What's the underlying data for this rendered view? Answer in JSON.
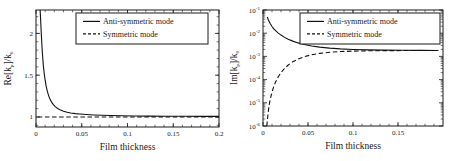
{
  "figure": {
    "name": "surface-plasmon-mode-dispersion",
    "panel_count": 2
  },
  "chart_data": [
    {
      "id": "left",
      "type": "line",
      "title": "",
      "xlabel": "Film thickness",
      "ylabel": "Re[k_p]/k_0",
      "ylabel_parts": {
        "prefix": "Re[k",
        "sub": "p",
        "mid": "]/k",
        "sub2": "0"
      },
      "xlim": [
        0,
        0.2
      ],
      "ylim": [
        0.88,
        2.28
      ],
      "xticks": [
        0,
        0.05,
        0.1,
        0.15,
        0.2
      ],
      "xtick_labels": [
        "0",
        "0.05",
        "0.1",
        "0.15",
        "0.2"
      ],
      "yticks": [
        1,
        1.5,
        2
      ],
      "ytick_labels": [
        "1",
        "1.5",
        "2"
      ],
      "yscale": "linear",
      "grid": false,
      "legend_position": "top-right",
      "series": [
        {
          "name": "Anti-symmetric mode",
          "style": "solid",
          "x": [
            0.0045,
            0.005,
            0.0055,
            0.006,
            0.0065,
            0.007,
            0.008,
            0.009,
            0.01,
            0.011,
            0.012,
            0.013,
            0.014,
            0.015,
            0.017,
            0.019,
            0.021,
            0.024,
            0.027,
            0.03,
            0.034,
            0.038,
            0.043,
            0.048,
            0.055,
            0.063,
            0.072,
            0.082,
            0.094,
            0.108,
            0.124,
            0.142,
            0.162,
            0.182,
            0.2
          ],
          "y": [
            2.28,
            2.18,
            2.06,
            1.95,
            1.85,
            1.76,
            1.62,
            1.52,
            1.44,
            1.375,
            1.325,
            1.285,
            1.25,
            1.222,
            1.178,
            1.147,
            1.124,
            1.099,
            1.082,
            1.069,
            1.057,
            1.048,
            1.04,
            1.035,
            1.029,
            1.024,
            1.02,
            1.017,
            1.014,
            1.012,
            1.01,
            1.009,
            1.008,
            1.007,
            1.007
          ]
        },
        {
          "name": "Symmetric mode",
          "style": "dashed",
          "x": [
            0.002,
            0.01,
            0.02,
            0.04,
            0.06,
            0.08,
            0.1,
            0.12,
            0.14,
            0.16,
            0.18,
            0.2
          ],
          "y": [
            0.999,
            0.999,
            0.999,
            1.0,
            1.0,
            1.0,
            1.0,
            1.0,
            1.0,
            1.0,
            1.0,
            1.0
          ]
        }
      ]
    },
    {
      "id": "right",
      "type": "line",
      "title": "",
      "xlabel": "Film thickness",
      "ylabel": "Im[k_p]/k_0",
      "ylabel_parts": {
        "prefix": "Im[k",
        "sub": "p",
        "mid": "]/k",
        "sub2": "0"
      },
      "xlim": [
        0,
        0.2
      ],
      "ylim": [
        1e-06,
        0.1
      ],
      "xticks": [
        0,
        0.05,
        0.1,
        0.15
      ],
      "xtick_labels": [
        "0",
        "0.05",
        "0.1",
        "0.15"
      ],
      "yticks": [
        0.1,
        0.01,
        0.001,
        0.0001,
        1e-05,
        1e-06
      ],
      "ytick_labels": [
        "10-1",
        "10-2",
        "10-3",
        "10-4",
        "10-5",
        "10-6"
      ],
      "ytick_exponents": [
        "-1",
        "-2",
        "-3",
        "-4",
        "-5",
        "-6"
      ],
      "ytick_mantissa": "10",
      "yscale": "log",
      "grid": false,
      "legend_position": "top-right",
      "series": [
        {
          "name": "Anti-symmetric mode",
          "style": "solid",
          "x": [
            0.0048,
            0.006,
            0.007,
            0.008,
            0.01,
            0.012,
            0.014,
            0.017,
            0.02,
            0.024,
            0.028,
            0.033,
            0.039,
            0.046,
            0.054,
            0.063,
            0.074,
            0.086,
            0.1,
            0.116,
            0.134,
            0.154,
            0.175,
            0.195
          ],
          "y": [
            0.05,
            0.037,
            0.031,
            0.026,
            0.0195,
            0.0155,
            0.0128,
            0.0101,
            0.0083,
            0.0066,
            0.0055,
            0.00455,
            0.00382,
            0.00325,
            0.00283,
            0.00252,
            0.00228,
            0.00211,
            0.00199,
            0.00191,
            0.00186,
            0.00183,
            0.00181,
            0.0018
          ]
        },
        {
          "name": "Symmetric mode",
          "style": "dashed",
          "x": [
            0.0042,
            0.005,
            0.006,
            0.007,
            0.008,
            0.01,
            0.012,
            0.014,
            0.017,
            0.02,
            0.024,
            0.028,
            0.033,
            0.039,
            0.046,
            0.054,
            0.063,
            0.074,
            0.086,
            0.1,
            0.116,
            0.134,
            0.154,
            0.175,
            0.195
          ],
          "y": [
            1e-06,
            2e-06,
            4.6e-06,
            8.5e-06,
            1.38e-05,
            2.9e-05,
            5.1e-05,
            7.9e-05,
            0.000133,
            0.000199,
            0.000305,
            0.000425,
            0.000585,
            0.00077,
            0.000975,
            0.001175,
            0.001355,
            0.001505,
            0.001615,
            0.00169,
            0.00174,
            0.00177,
            0.001785,
            0.001793,
            0.001797
          ]
        }
      ]
    }
  ],
  "legend": {
    "entries": [
      {
        "label": "Anti-symmetric mode",
        "style": "solid"
      },
      {
        "label": "Symmetric mode",
        "style": "dashed"
      }
    ]
  }
}
